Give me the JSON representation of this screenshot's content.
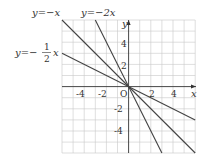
{
  "diagram": {
    "type": "coordinate-plane",
    "x_axis_label": "x",
    "y_axis_label": "y",
    "origin_label": "O",
    "x_range": [
      -6,
      6
    ],
    "y_range": [
      -6,
      6
    ],
    "x_ticks": [
      "-4",
      "-2",
      "2",
      "4"
    ],
    "y_ticks": [
      "4",
      "2",
      "-2",
      "-4"
    ],
    "lines": [
      {
        "label": "y = -x",
        "slope": -1
      },
      {
        "label": "y = -2x",
        "slope": -2
      },
      {
        "label": "y = -1/2 x",
        "slope": -0.5
      }
    ],
    "labels": {
      "line1_prefix": "y=",
      "line1_rest": "−x",
      "line2_prefix": "y=",
      "line2_rest": "−2x",
      "line3_prefix": "y=−",
      "line3_num": "1",
      "line3_den": "2",
      "line3_var": "x"
    }
  }
}
